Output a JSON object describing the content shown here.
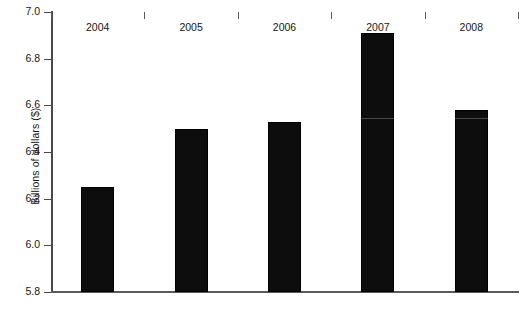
{
  "chart_data": {
    "type": "bar",
    "title": "",
    "xlabel": "",
    "ylabel": "Billions of dollars ($)",
    "categories": [
      "2004",
      "2005",
      "2006",
      "2007",
      "2008"
    ],
    "values": [
      6.25,
      6.5,
      6.53,
      6.91,
      6.58
    ],
    "ylim": [
      5.8,
      7.0
    ],
    "ytick_labels": [
      "5.8",
      "6.0",
      "6.2",
      "6.4",
      "6.6",
      "6.8",
      "7.0"
    ],
    "ytick_values": [
      5.8,
      6.0,
      6.2,
      6.4,
      6.6,
      6.8,
      7.0
    ],
    "grid": false,
    "legend": null,
    "bar_color": "#0d0d0d",
    "axis_color": "#4a4a4a"
  },
  "axes": {
    "y_title": "Billions of dollars ($)"
  },
  "footer": {
    "caption": ""
  }
}
